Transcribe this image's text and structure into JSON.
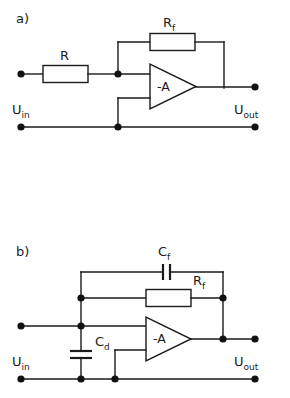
{
  "figure": {
    "background_color": "#ffffff",
    "line_color": "#1a1a1a",
    "width": 290,
    "height": 398
  },
  "panels": [
    {
      "id": "panel-a",
      "label": "a)",
      "description": "Inverting amplifier with input resistor R and feedback resistor Rf",
      "amplifier_label": "-A",
      "input_terminal_label": "U",
      "input_terminal_sub": "in",
      "output_terminal_label": "U",
      "output_terminal_sub": "out",
      "components": [
        {
          "name": "resistor-r",
          "type": "resistor",
          "label": "R",
          "sub": ""
        },
        {
          "name": "resistor-rf",
          "type": "resistor",
          "label": "R",
          "sub": "f"
        }
      ]
    },
    {
      "id": "panel-b",
      "label": "b)",
      "description": "Inverting amplifier with feedback capacitor Cf, feedback resistor Rf and input capacitor Cd",
      "amplifier_label": "-A",
      "input_terminal_label": "U",
      "input_terminal_sub": "in",
      "output_terminal_label": "U",
      "output_terminal_sub": "out",
      "components": [
        {
          "name": "capacitor-cf",
          "type": "capacitor",
          "label": "C",
          "sub": "f"
        },
        {
          "name": "resistor-rf",
          "type": "resistor",
          "label": "R",
          "sub": "f"
        },
        {
          "name": "capacitor-cd",
          "type": "capacitor",
          "label": "C",
          "sub": "d"
        }
      ]
    }
  ],
  "labels": {
    "panel_a_tag": "a)",
    "panel_b_tag": "b)",
    "amp_a": "-A",
    "amp_b": "-A",
    "r_a": "R",
    "rf_a_main": "R",
    "rf_a_sub": "f",
    "cf_b_main": "C",
    "cf_b_sub": "f",
    "rf_b_main": "R",
    "rf_b_sub": "f",
    "cd_b_main": "C",
    "cd_b_sub": "d",
    "uin_a_main": "U",
    "uin_a_sub": "in",
    "uout_a_main": "U",
    "uout_a_sub": "out",
    "uin_b_main": "U",
    "uin_b_sub": "in",
    "uout_b_main": "U",
    "uout_b_sub": "out"
  }
}
